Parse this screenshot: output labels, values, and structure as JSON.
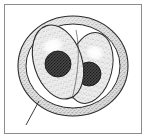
{
  "figure": {
    "title": "Dividing cell with two daughter nuclei",
    "type": "stipple-illustration",
    "frame": {
      "border_color": "#8c8c8c",
      "background_color": "#ffffff",
      "x": 4,
      "y": 4,
      "width": 138,
      "height": 130
    },
    "palette": {
      "outline": "#2b2b2b",
      "membrane_fill": "#d8d8d8",
      "membrane_stipple": "#6e6e6e",
      "cytoplasm_fill": "#e8e8e8",
      "cytoplasm_stipple": "#8a8a8a",
      "nucleus_fill": "#3a3a3a",
      "nucleus_stipple": "#111111",
      "highlight": "#ffffff",
      "leader_line": "#3a3a3a"
    },
    "parts": [
      {
        "name": "outer-membrane",
        "label": "Outer membrane / capsule",
        "shape": "ring",
        "cx": 73,
        "cy": 66,
        "rx": 55,
        "ry": 50,
        "thickness": 8
      },
      {
        "name": "daughter-cell-left",
        "label": "Left daughter cell",
        "shape": "ellipse",
        "cx": 58,
        "cy": 62,
        "rx": 24,
        "ry": 38,
        "rotation": -18
      },
      {
        "name": "daughter-cell-right",
        "label": "Right daughter cell",
        "shape": "ellipse",
        "cx": 90,
        "cy": 68,
        "rx": 22,
        "ry": 36,
        "rotation": 14
      },
      {
        "name": "nucleus-left",
        "label": "Left nucleus",
        "shape": "circle",
        "cx": 58,
        "cy": 64,
        "r": 13
      },
      {
        "name": "nucleus-right",
        "label": "Right nucleus",
        "shape": "circle",
        "cx": 89,
        "cy": 74,
        "r": 12
      },
      {
        "name": "highlight-left",
        "label": "Left cell highlight",
        "cx": 57,
        "cy": 46,
        "rx": 12,
        "ry": 9
      },
      {
        "name": "highlight-right",
        "label": "Right cell highlight",
        "cx": 91,
        "cy": 52,
        "rx": 10,
        "ry": 8
      },
      {
        "name": "leader-line",
        "label": "Pointer to outer membrane",
        "x1": 39,
        "y1": 101,
        "x2": 26,
        "y2": 125
      }
    ]
  }
}
